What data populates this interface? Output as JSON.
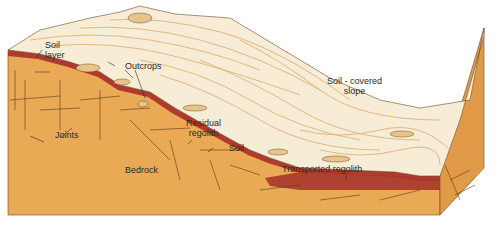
{
  "diagram": {
    "type": "block-diagram",
    "colors": {
      "bedrock": "#e9a955",
      "bedrock_side": "#e09a48",
      "soil": "#b03a2e",
      "surface": "#f7ecd6",
      "surface_texture": "#d9a05a",
      "joint_lines": "#5a3a1a",
      "background": "#ffffff"
    },
    "labels": {
      "soil_layer_1": "Soil",
      "soil_layer_2": "layer",
      "outcrops": "Outcrops",
      "soil_covered_slope_1": "Soil - covered",
      "soil_covered_slope_2": "slope",
      "joints": "Joints",
      "residual_regolith_1": "Residual",
      "residual_regolith_2": "regolith",
      "soil": "Soil",
      "bedrock": "Bedrock",
      "transported_regolith": "Transported regolith"
    }
  }
}
